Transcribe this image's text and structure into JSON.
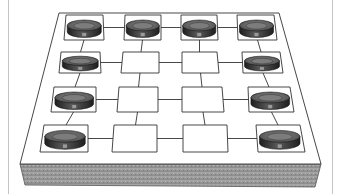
{
  "figure": {
    "grid": {
      "rows": 4,
      "cols": 4
    },
    "colors": {
      "background": "#ffffff",
      "board_top": "#ffffff",
      "board_edge": "#9a9a9a",
      "line": "#3a3a3a",
      "piece_dark": "#2e2e2e",
      "piece_mid": "#6e6e6e",
      "piece_light": "#9a9a9a",
      "frame": "#c4c4c4"
    },
    "pieces": [
      {
        "row": 1,
        "col": 1
      },
      {
        "row": 1,
        "col": 2
      },
      {
        "row": 1,
        "col": 3
      },
      {
        "row": 1,
        "col": 4
      },
      {
        "row": 2,
        "col": 1
      },
      {
        "row": 2,
        "col": 4
      },
      {
        "row": 3,
        "col": 1
      },
      {
        "row": 3,
        "col": 4
      },
      {
        "row": 4,
        "col": 1
      },
      {
        "row": 4,
        "col": 4
      }
    ],
    "empty_squares": [
      {
        "row": 2,
        "col": 2
      },
      {
        "row": 2,
        "col": 3
      },
      {
        "row": 3,
        "col": 2
      },
      {
        "row": 3,
        "col": 3
      },
      {
        "row": 4,
        "col": 2
      },
      {
        "row": 4,
        "col": 3
      }
    ]
  }
}
